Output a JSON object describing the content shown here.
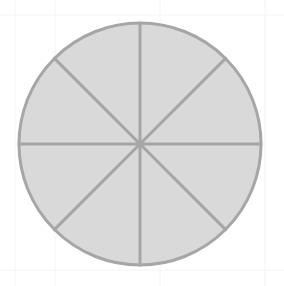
{
  "diagram": {
    "type": "fraction-circle",
    "sectors": 8,
    "center": [
      140,
      144
    ],
    "radius": 121,
    "colors": {
      "fill": "#d9d9d9",
      "stroke": "#a6a6a6",
      "background": "#ffffff"
    }
  }
}
